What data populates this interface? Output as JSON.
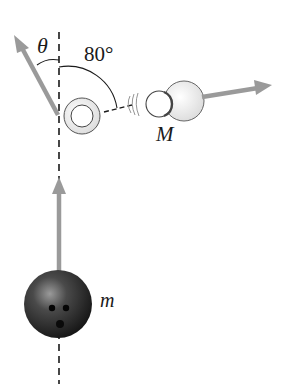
{
  "diagram": {
    "labels": {
      "theta": "θ",
      "angle": "80°",
      "pin_mass": "M",
      "ball_mass": "m"
    },
    "colors": {
      "arrow": "#9a9a9a",
      "line": "#1a1a1a",
      "ball_dark": "#1c1c1c",
      "ball_light": "#8a8a8a",
      "pin_fill": "#e8e8e8",
      "background": "#ffffff"
    },
    "elements": [
      {
        "id": "vertical-reference-line",
        "style": "dashed"
      },
      {
        "id": "pin-struck",
        "description": "pin after collision, velocity at angle theta left of vertical"
      },
      {
        "id": "pin-M",
        "description": "pin of mass M, velocity at 80 degrees right of vertical"
      },
      {
        "id": "ball-m",
        "description": "bowling ball of mass m moving upward"
      }
    ]
  }
}
